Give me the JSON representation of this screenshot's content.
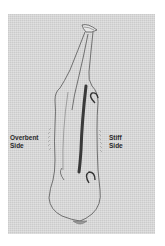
{
  "diagram": {
    "labels": {
      "left": {
        "line1": "Overbent",
        "line2": "Side"
      },
      "right": {
        "line1": "Stiff",
        "line2": "Side"
      }
    },
    "colors": {
      "background": "#ffffff",
      "panel": "#d6d6d6",
      "outline": "#555555",
      "spine": "#3a3a3a"
    }
  }
}
